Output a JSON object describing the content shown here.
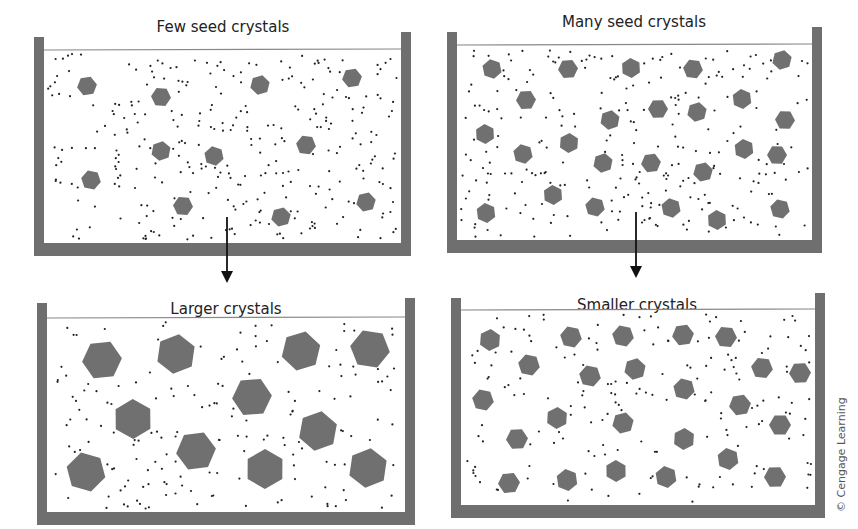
{
  "colors": {
    "wall": "#6f6f6f",
    "crystal": "#707070",
    "dot": "#222222",
    "surface_line": "#888888",
    "arrow": "#111111",
    "text": "#222222"
  },
  "credit": "© Cengage Learning",
  "beakers": [
    {
      "id": "few-seed",
      "title": "Few seed crystals",
      "title_pos": [
        223,
        20
      ],
      "walls": {
        "left_x": 34,
        "left_top": 37,
        "right_x": 401,
        "right_top": 32,
        "bottom_y": 243,
        "thickness": 10
      },
      "surface_y": 50,
      "crystal_radius": 10,
      "crystals": [
        [
          87,
          86
        ],
        [
          161,
          97
        ],
        [
          260,
          85
        ],
        [
          352,
          78
        ],
        [
          161,
          151
        ],
        [
          214,
          156
        ],
        [
          306,
          145
        ],
        [
          91,
          180
        ],
        [
          183,
          206
        ],
        [
          281,
          217
        ],
        [
          366,
          202
        ]
      ],
      "dot_count": 330,
      "seed": 11
    },
    {
      "id": "many-seed",
      "title": "Many seed crystals",
      "title_pos": [
        634,
        15
      ],
      "walls": {
        "left_x": 447,
        "left_top": 32,
        "right_x": 812,
        "right_top": 27,
        "bottom_y": 240,
        "thickness": 10
      },
      "surface_y": 45,
      "crystal_radius": 10,
      "crystals": [
        [
          492,
          69
        ],
        [
          568,
          69
        ],
        [
          631,
          68
        ],
        [
          693,
          69
        ],
        [
          782,
          60
        ],
        [
          526,
          100
        ],
        [
          610,
          120
        ],
        [
          658,
          109
        ],
        [
          697,
          112
        ],
        [
          742,
          99
        ],
        [
          785,
          120
        ],
        [
          485,
          134
        ],
        [
          523,
          154
        ],
        [
          569,
          143
        ],
        [
          603,
          163
        ],
        [
          651,
          163
        ],
        [
          703,
          172
        ],
        [
          744,
          149
        ],
        [
          777,
          155
        ],
        [
          553,
          195
        ],
        [
          595,
          207
        ],
        [
          671,
          208
        ],
        [
          717,
          220
        ],
        [
          780,
          209
        ],
        [
          486,
          213
        ]
      ],
      "dot_count": 300,
      "seed": 23
    },
    {
      "id": "larger",
      "title": "Larger crystals",
      "title_pos": [
        226,
        302
      ],
      "walls": {
        "left_x": 37,
        "left_top": 303,
        "right_x": 405,
        "right_top": 298,
        "bottom_y": 512,
        "thickness": 10
      },
      "surface_y": 318,
      "crystal_radius": 20,
      "crystals": [
        [
          102,
          360
        ],
        [
          176,
          354
        ],
        [
          301,
          351
        ],
        [
          370,
          349
        ],
        [
          252,
          397
        ],
        [
          133,
          419
        ],
        [
          318,
          431
        ],
        [
          196,
          451
        ],
        [
          86,
          472
        ],
        [
          265,
          469
        ],
        [
          368,
          468
        ]
      ],
      "dot_count": 210,
      "seed": 37
    },
    {
      "id": "smaller",
      "title": "Smaller crystals",
      "title_pos": [
        637,
        298
      ],
      "walls": {
        "left_x": 451,
        "left_top": 298,
        "right_x": 815,
        "right_top": 293,
        "bottom_y": 505,
        "thickness": 10
      },
      "surface_y": 310,
      "crystal_radius": 11,
      "crystals": [
        [
          490,
          340
        ],
        [
          571,
          337
        ],
        [
          623,
          336
        ],
        [
          683,
          335
        ],
        [
          726,
          337
        ],
        [
          529,
          365
        ],
        [
          590,
          376
        ],
        [
          635,
          369
        ],
        [
          762,
          368
        ],
        [
          800,
          373
        ],
        [
          483,
          400
        ],
        [
          684,
          389
        ],
        [
          740,
          405
        ],
        [
          557,
          418
        ],
        [
          623,
          423
        ],
        [
          780,
          425
        ],
        [
          517,
          439
        ],
        [
          684,
          439
        ],
        [
          728,
          459
        ],
        [
          509,
          483
        ],
        [
          567,
          480
        ],
        [
          616,
          471
        ],
        [
          666,
          477
        ],
        [
          775,
          477
        ]
      ],
      "dot_count": 200,
      "seed": 51
    }
  ],
  "arrows": [
    {
      "id": "arrow-few-to-larger",
      "x": 227,
      "y1": 217,
      "y2": 283
    },
    {
      "id": "arrow-many-to-smaller",
      "x": 636,
      "y1": 212,
      "y2": 278
    }
  ]
}
